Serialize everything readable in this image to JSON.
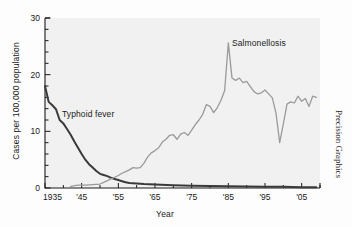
{
  "chart_data": {
    "type": "line",
    "title": "",
    "xlabel": "Year",
    "ylabel": "Cases per 100,000 population",
    "credit": "Precision Graphics",
    "xlim": [
      1935,
      2010
    ],
    "ylim": [
      0,
      30
    ],
    "yticks": [
      0,
      10,
      20,
      30
    ],
    "ytick_labels": [
      "0",
      "10",
      "20",
      "30"
    ],
    "y_minor_step": 2,
    "xticks": [
      1935,
      1945,
      1955,
      1965,
      1975,
      1985,
      1995,
      2005
    ],
    "xtick_labels": [
      "1935",
      "'45",
      "'55",
      "'65",
      "'75",
      "'85",
      "'95",
      "'05"
    ],
    "grid": false,
    "legend_position": "inline-annotations",
    "colors": {
      "typhoid": "#3a3a3a",
      "salmonellosis": "#9a9a9a",
      "axis": "#1a1a1a",
      "background": "#f2f2f2"
    },
    "series": [
      {
        "name": "Typhoid fever",
        "color": "#3a3a3a",
        "label_x": 1942,
        "label_y": 9,
        "x": [
          1935,
          1936,
          1937,
          1938,
          1939,
          1940,
          1941,
          1942,
          1943,
          1944,
          1945,
          1946,
          1947,
          1948,
          1949,
          1950,
          1951,
          1952,
          1953,
          1954,
          1955,
          1956,
          1957,
          1958,
          1960,
          1962,
          1965,
          1970,
          1975,
          1980,
          1985,
          1990,
          1995,
          2000,
          2005,
          2009
        ],
        "values": [
          18.0,
          15.2,
          14.6,
          13.9,
          12.0,
          11.4,
          10.4,
          9.4,
          8.2,
          7.1,
          6.0,
          5.0,
          4.2,
          3.6,
          3.0,
          2.5,
          2.3,
          2.1,
          1.8,
          1.6,
          1.4,
          1.2,
          1.0,
          0.9,
          0.8,
          0.7,
          0.6,
          0.5,
          0.4,
          0.35,
          0.3,
          0.25,
          0.2,
          0.2,
          0.15,
          0.15
        ]
      },
      {
        "name": "Salmonellosis",
        "color": "#9a9a9a",
        "label_x": 1988,
        "label_y": 24,
        "x": [
          1942,
          1944,
          1946,
          1948,
          1950,
          1951,
          1952,
          1953,
          1954,
          1955,
          1956,
          1957,
          1958,
          1959,
          1960,
          1961,
          1962,
          1963,
          1964,
          1965,
          1966,
          1967,
          1968,
          1969,
          1970,
          1971,
          1972,
          1973,
          1974,
          1975,
          1976,
          1977,
          1978,
          1979,
          1980,
          1981,
          1982,
          1983,
          1984,
          1985,
          1986,
          1987,
          1988,
          1989,
          1990,
          1991,
          1992,
          1993,
          1994,
          1995,
          1996,
          1997,
          1998,
          1999,
          2000,
          2001,
          2002,
          2003,
          2004,
          2005,
          2006,
          2007,
          2008,
          2009
        ],
        "values": [
          0.3,
          0.5,
          0.5,
          0.6,
          0.7,
          1.0,
          1.3,
          1.6,
          1.9,
          2.2,
          2.6,
          2.9,
          3.2,
          3.6,
          3.5,
          3.6,
          4.4,
          5.5,
          6.2,
          6.6,
          7.1,
          8.1,
          8.6,
          9.3,
          9.4,
          8.6,
          9.5,
          9.8,
          9.3,
          10.2,
          11.2,
          12.0,
          13.0,
          14.7,
          14.4,
          13.3,
          14.2,
          15.5,
          17.2,
          25.6,
          19.4,
          19.0,
          19.4,
          18.6,
          18.8,
          17.9,
          17.0,
          16.6,
          16.8,
          17.3,
          16.6,
          15.9,
          13.2,
          8.0,
          11.3,
          14.8,
          15.2,
          15.0,
          16.2,
          15.3,
          15.8,
          14.4,
          16.2,
          16.0
        ]
      }
    ]
  }
}
